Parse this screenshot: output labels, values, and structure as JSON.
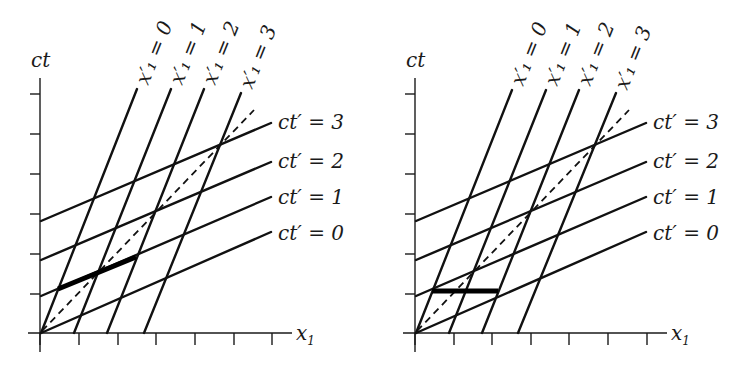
{
  "diagrams": [
    {
      "id": "left",
      "y_axis_label": "ct",
      "x_axis_label": "x",
      "x_axis_subscript": "1",
      "highlight": "segment along ct' = 1 between x'1 = 0 and x'1 = 1 (simultaneous in primed frame)",
      "labels": {
        "xp0": "x′₁ = 0",
        "xp1": "x′₁ = 1",
        "xp2": "x′₁ = 2",
        "xp3": "x′₁ = 3",
        "ctp3": "ct′ = 3",
        "ctp2": "ct′ = 2",
        "ctp1": "ct′ = 1",
        "ctp0": "ct′ = 0"
      }
    },
    {
      "id": "right",
      "y_axis_label": "ct",
      "x_axis_label": "x",
      "x_axis_subscript": "1",
      "highlight": "horizontal segment at ct = 1 between x'1 = 0 and x'1 = 1 (simultaneous in unprimed frame)",
      "labels": {
        "xp0": "x′₁ = 0",
        "xp1": "x′₁ = 1",
        "xp2": "x′₁ = 2",
        "xp3": "x′₁ = 3",
        "ctp3": "ct′ = 3",
        "ctp2": "ct′ = 2",
        "ctp1": "ct′ = 1",
        "ctp0": "ct′ = 0"
      }
    }
  ],
  "colors": {
    "ink": "#111111",
    "background": "#ffffff"
  }
}
